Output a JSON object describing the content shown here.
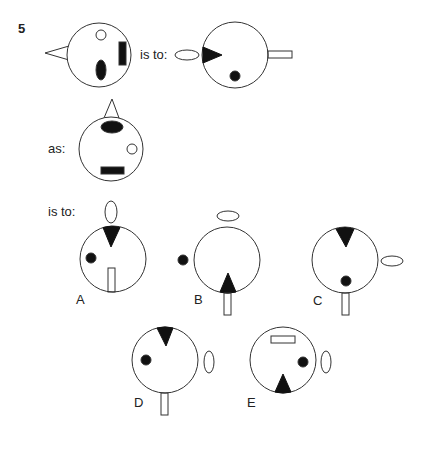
{
  "question": {
    "number": "5",
    "connector_1": "is to:",
    "connector_2": "as:",
    "connector_3": "is to:"
  },
  "options": [
    {
      "letter": "A"
    },
    {
      "letter": "B"
    },
    {
      "letter": "C"
    },
    {
      "letter": "D"
    },
    {
      "letter": "E"
    }
  ],
  "colors": {
    "stroke": "#333333",
    "fill": "#111111",
    "background": "#ffffff"
  },
  "figures": {
    "figure_1": {
      "description": "Circle with outward triangle on left, small hollow circle top, filled vertical ellipse bottom, filled vertical rectangle right"
    },
    "figure_2": {
      "description": "Circle with hollow horizontal ellipse outside left, filled triangle pointing inward at left, filled dot bottom, hollow horizontal rectangle outside right"
    },
    "figure_3": {
      "description": "Circle with outward triangle on top, filled horizontal ellipse top, small hollow circle right, filled horizontal rectangle bottom"
    },
    "option_A": {
      "description": "Hollow vertical ellipse above, filled triangle pointing down at top, dot left, hollow vertical rectangle inside bottom"
    },
    "option_B": {
      "description": "Hollow horizontal ellipse above, dot outside left, filled triangle pointing up at bottom, hollow vertical rectangle outside bottom"
    },
    "option_C": {
      "description": "Filled triangle pointing down at top, hollow horizontal ellipse outside right, dot inside bottom, hollow vertical rectangle outside bottom"
    },
    "option_D": {
      "description": "Filled triangle pointing down at top, dot inside left, hollow vertical ellipse outside right, hollow vertical rectangle outside bottom"
    },
    "option_E": {
      "description": "Hollow horizontal rectangle inside top, dot inside right, hollow vertical ellipse outside right, filled triangle pointing up at bottom"
    }
  }
}
